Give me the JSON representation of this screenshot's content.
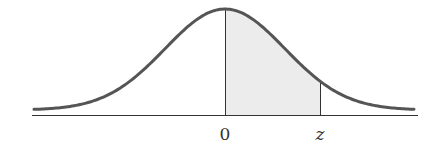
{
  "chart_data": {
    "type": "area",
    "title": "",
    "xlabel": "",
    "ylabel": "",
    "tick_labels": [
      "0",
      "z"
    ],
    "curve": {
      "distribution": "standard normal",
      "mean": 0,
      "sd": 1
    },
    "shaded_region": {
      "from": "0",
      "to": "z"
    },
    "grid": false,
    "legend": null
  },
  "labels": {
    "zero": "0",
    "z": "z"
  },
  "colors": {
    "curve": "#555555",
    "shade": "#ececec",
    "axis": "#333333"
  }
}
